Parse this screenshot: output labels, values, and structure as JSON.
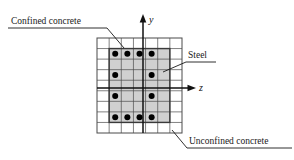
{
  "figure": {
    "background_color": "#ffffff"
  },
  "axes": {
    "vertical": {
      "name": "y",
      "label": "y",
      "direction": "up",
      "x": 143,
      "y_start": 133,
      "y_end": 14,
      "color": "#111111"
    },
    "horizontal": {
      "name": "z",
      "label": "z",
      "direction": "right",
      "y": 88,
      "x_start": 97,
      "x_end": 196,
      "color": "#111111"
    }
  },
  "section": {
    "grid": {
      "x": 97,
      "y": 38,
      "width": 85,
      "height": 95,
      "columns": 7,
      "rows": 9,
      "cell_width": 12.14,
      "cell_height": 10.56,
      "line_color": "#4a4a4a",
      "line_width": 0.7
    },
    "confined_core": {
      "label": "confined-core",
      "fill_color": "#d0d0d0",
      "border_color": "#3a3a3a",
      "border_width": 1.4,
      "col_start": 1,
      "col_end": 6,
      "row_start": 1,
      "row_end": 8
    },
    "unconfined_cover": {
      "label": "unconfined-cover",
      "fill_color": "#ffffff"
    }
  },
  "steel_bars": {
    "color": "#000000",
    "radius": 3.0,
    "count": 12,
    "positions": [
      {
        "col": 1,
        "row": 1
      },
      {
        "col": 2,
        "row": 1
      },
      {
        "col": 3,
        "row": 1
      },
      {
        "col": 4,
        "row": 1
      },
      {
        "col": 1,
        "row": 3
      },
      {
        "col": 4,
        "row": 3
      },
      {
        "col": 1,
        "row": 5
      },
      {
        "col": 4,
        "row": 5
      },
      {
        "col": 1,
        "row": 7
      },
      {
        "col": 2,
        "row": 7
      },
      {
        "col": 3,
        "row": 7
      },
      {
        "col": 4,
        "row": 7
      }
    ]
  },
  "annotations": [
    {
      "id": "confined-concrete",
      "text": "Confined concrete",
      "text_x": 11,
      "text_y": 17,
      "underline": {
        "x1": 8,
        "y1": 28,
        "x2": 107,
        "y2": 28
      },
      "leader": {
        "x1": 107,
        "y1": 28,
        "x2": 124,
        "y2": 48
      },
      "color": "#1a1a1a"
    },
    {
      "id": "steel",
      "text": "Steel",
      "text_x": 188,
      "text_y": 51,
      "underline": {
        "x1": 186,
        "y1": 62,
        "x2": 216,
        "y2": 62
      },
      "leader": {
        "x1": 186,
        "y1": 62,
        "x2": 163,
        "y2": 72
      },
      "color": "#1a1a1a"
    },
    {
      "id": "unconfined-concrete",
      "text": "Unconfined concrete",
      "text_x": 189,
      "text_y": 137,
      "underline": {
        "x1": 187,
        "y1": 148,
        "x2": 292,
        "y2": 148
      },
      "leader": {
        "x1": 187,
        "y1": 148,
        "x2": 172,
        "y2": 130
      },
      "color": "#1a1a1a"
    }
  ]
}
